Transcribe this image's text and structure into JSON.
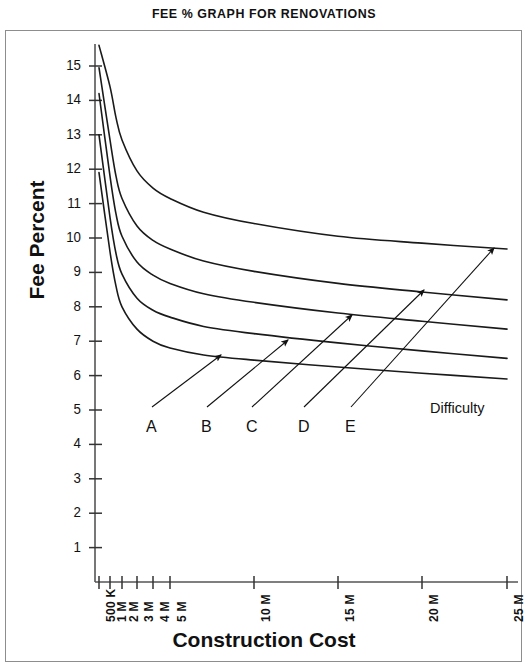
{
  "chart_data": {
    "type": "line",
    "title": "FEE % GRAPH FOR RENOVATIONS",
    "xlabel": "Construction Cost",
    "ylabel": "Fee Percent",
    "grid": false,
    "legend_position": "inline-arrow-labels",
    "x_tick_labels": [
      "500 K",
      "1 M",
      "2 M",
      "3 M",
      "4 M",
      "5 M",
      "10 M",
      "15 M",
      "20 M",
      "25 M"
    ],
    "x_tick_values": [
      0.5,
      1,
      2,
      3,
      4,
      5,
      10,
      15,
      20,
      25
    ],
    "x_tick_px": [
      99,
      110,
      122,
      137,
      153,
      170,
      254,
      338,
      422,
      507
    ],
    "y_tick_labels": [
      "1",
      "2",
      "3",
      "4",
      "5",
      "6",
      "7",
      "8",
      "9",
      "10",
      "11",
      "12",
      "13",
      "14",
      "15"
    ],
    "y_tick_values": [
      1,
      2,
      3,
      4,
      5,
      6,
      7,
      8,
      9,
      10,
      11,
      12,
      13,
      14,
      15
    ],
    "ylim": [
      0,
      15.9
    ],
    "xlim_px": [
      95,
      510
    ],
    "annotation": "Difficulty",
    "series": [
      {
        "name": "A",
        "x": [
          0.5,
          1,
          1.5,
          2,
          3,
          4,
          5,
          7,
          10,
          15,
          20,
          25
        ],
        "values": [
          11.9,
          9.6,
          8.6,
          8.0,
          7.35,
          7.0,
          6.8,
          6.6,
          6.45,
          6.25,
          6.07,
          5.9
        ]
      },
      {
        "name": "B",
        "x": [
          0.5,
          1,
          1.5,
          2,
          3,
          4,
          5,
          7,
          10,
          15,
          20,
          25
        ],
        "values": [
          13.0,
          10.6,
          9.55,
          8.95,
          8.25,
          7.9,
          7.7,
          7.43,
          7.22,
          6.95,
          6.72,
          6.5
        ]
      },
      {
        "name": "C",
        "x": [
          0.5,
          1,
          1.5,
          2,
          3,
          4,
          5,
          7,
          10,
          15,
          20,
          25
        ],
        "values": [
          14.2,
          11.8,
          10.7,
          10.05,
          9.3,
          8.92,
          8.68,
          8.38,
          8.13,
          7.82,
          7.58,
          7.35
        ]
      },
      {
        "name": "D",
        "x": [
          0.5,
          1,
          1.5,
          2,
          3,
          4,
          5,
          7,
          10,
          15,
          20,
          25
        ],
        "values": [
          14.95,
          12.85,
          11.8,
          11.15,
          10.35,
          9.93,
          9.68,
          9.33,
          9.03,
          8.68,
          8.43,
          8.2
        ]
      },
      {
        "name": "E",
        "x": [
          0.5,
          1,
          1.5,
          2,
          3,
          4,
          5,
          7,
          10,
          15,
          20,
          25
        ],
        "values": [
          15.6,
          14.4,
          13.5,
          12.85,
          11.95,
          11.45,
          11.15,
          10.75,
          10.42,
          10.05,
          9.85,
          9.68
        ]
      }
    ],
    "series_labels": [
      {
        "text": "A",
        "label_x": 146,
        "label_y": 418,
        "arrow_from_x": 152,
        "arrow_from_y": 407,
        "arrow_to_x": 221,
        "arrow_to_y": 355
      },
      {
        "text": "B",
        "label_x": 201,
        "label_y": 418,
        "arrow_from_x": 207,
        "arrow_from_y": 407,
        "arrow_to_x": 288,
        "arrow_to_y": 340
      },
      {
        "text": "C",
        "label_x": 246,
        "label_y": 418,
        "arrow_from_x": 252,
        "arrow_from_y": 407,
        "arrow_to_x": 352,
        "arrow_to_y": 315
      },
      {
        "text": "D",
        "label_x": 298,
        "label_y": 418,
        "arrow_from_x": 304,
        "arrow_from_y": 407,
        "arrow_to_x": 424,
        "arrow_to_y": 290
      },
      {
        "text": "E",
        "label_x": 345,
        "label_y": 418,
        "arrow_from_x": 351,
        "arrow_from_y": 407,
        "arrow_to_x": 494,
        "arrow_to_y": 248
      }
    ]
  }
}
